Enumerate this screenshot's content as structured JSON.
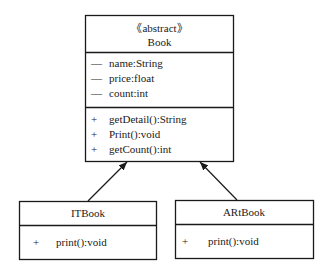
{
  "diagram": {
    "type": "uml-class-diagram",
    "classes": [
      {
        "id": "book",
        "stereotype": "《abstract》",
        "name": "Book",
        "attributes": [
          {
            "visibility": "—",
            "text": "name:String"
          },
          {
            "visibility": "—",
            "text": "price:float"
          },
          {
            "visibility": "—",
            "text": "count:int"
          }
        ],
        "methods": [
          {
            "visibility": "+",
            "text": "getDetail():String"
          },
          {
            "visibility": "+",
            "text": "Print():void"
          },
          {
            "visibility": "+",
            "text": "getCount():int"
          }
        ]
      },
      {
        "id": "itbook",
        "name": "ITBook",
        "attributes": [],
        "methods": [
          {
            "visibility": "+",
            "text": "print():void"
          }
        ]
      },
      {
        "id": "artbook",
        "name": "ARtBook",
        "attributes": [],
        "methods": [
          {
            "visibility": "+",
            "text": "print():void"
          }
        ]
      }
    ],
    "relations": [
      {
        "type": "generalization",
        "from": "itbook",
        "to": "book"
      },
      {
        "type": "generalization",
        "from": "artbook",
        "to": "book"
      }
    ]
  }
}
